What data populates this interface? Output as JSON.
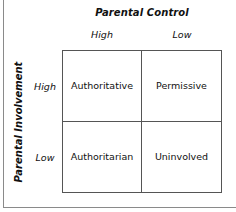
{
  "diagram": {
    "column_axis": {
      "title": "Parental Control",
      "labels": [
        "High",
        "Low"
      ]
    },
    "row_axis": {
      "title": "Parental Involvement",
      "labels": [
        "High",
        "Low"
      ]
    },
    "cells": [
      [
        "Authoritative",
        "Permissive"
      ],
      [
        "Authoritarian",
        "Uninvolved"
      ]
    ]
  }
}
